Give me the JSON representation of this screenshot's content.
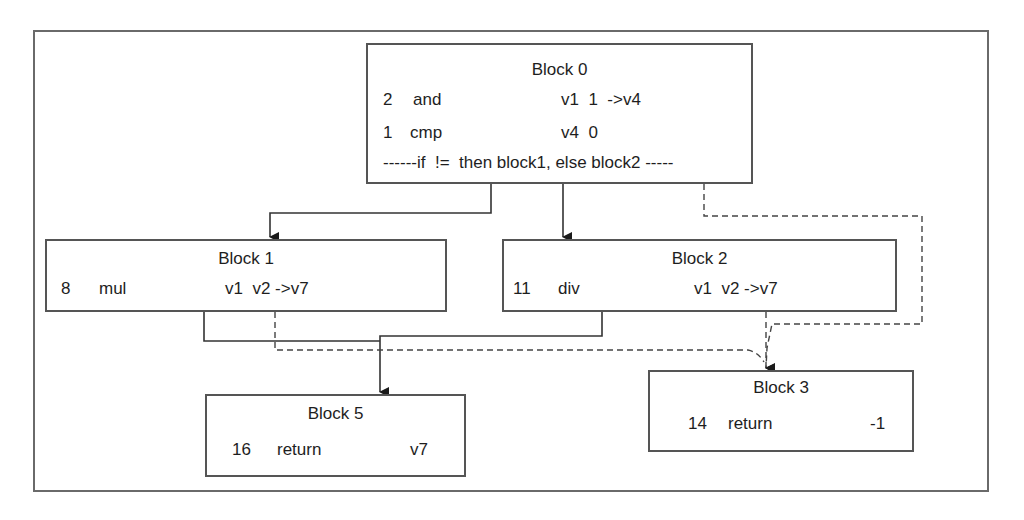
{
  "diagram": {
    "type": "control-flow-graph",
    "colors": {
      "line": "#333333",
      "border": "#555555",
      "frame": "#6a6a6a",
      "background": "#ffffff"
    },
    "blocks": {
      "b0": {
        "title": "Block 0",
        "instructions": [
          {
            "idx": "2",
            "op": "and",
            "args": "v1  1  ->v4"
          },
          {
            "idx": "1",
            "op": "cmp",
            "args": "v4  0"
          }
        ],
        "branch": "------if  !=  then block1, else block2 -----"
      },
      "b1": {
        "title": "Block 1",
        "instructions": [
          {
            "idx": "8",
            "op": "mul",
            "args": "v1  v2 ->v7"
          }
        ]
      },
      "b2": {
        "title": "Block 2",
        "instructions": [
          {
            "idx": "11",
            "op": "div",
            "args": "v1  v2 ->v7"
          }
        ]
      },
      "b5": {
        "title": "Block 5",
        "instructions": [
          {
            "idx": "16",
            "op": "return",
            "args": "v7"
          }
        ]
      },
      "b3": {
        "title": "Block 3",
        "instructions": [
          {
            "idx": "14",
            "op": "return",
            "args": "-1"
          }
        ]
      }
    },
    "edges": [
      {
        "from": "Block 0",
        "to": "Block 1",
        "style": "solid"
      },
      {
        "from": "Block 0",
        "to": "Block 2",
        "style": "solid"
      },
      {
        "from": "Block 0",
        "to": "Block 3",
        "style": "dashed"
      },
      {
        "from": "Block 1",
        "to": "Block 5",
        "style": "solid"
      },
      {
        "from": "Block 2",
        "to": "Block 5",
        "style": "solid"
      },
      {
        "from": "Block 1",
        "to": "Block 3",
        "style": "dashed"
      },
      {
        "from": "Block 2",
        "to": "Block 3",
        "style": "dashed"
      }
    ]
  }
}
